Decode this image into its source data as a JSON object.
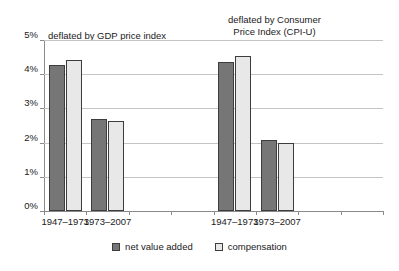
{
  "chart_data": {
    "type": "bar",
    "title": "",
    "xlabel": "",
    "ylabel": "",
    "ylim": [
      0,
      5
    ],
    "ytick_labels": [
      "5%",
      "4%",
      "3%",
      "2%",
      "1%",
      "0%"
    ],
    "ytick_values": [
      5,
      4,
      3,
      2,
      1,
      0
    ],
    "grid": true,
    "legend_position": "bottom",
    "categories": [
      "1947–1973",
      "1973–2007",
      "1947–1973",
      "1973–2007"
    ],
    "series": [
      {
        "name": "net value added",
        "color": "#767676",
        "values": [
          4.28,
          2.7,
          4.37,
          2.09
        ]
      },
      {
        "name": "compensation",
        "color": "#e8e8e8",
        "values": [
          4.42,
          2.62,
          4.52,
          2.0
        ]
      }
    ],
    "groups": [
      {
        "annotation": "deflated by GDP price index",
        "categories": [
          "1947–1973",
          "1973–2007"
        ]
      },
      {
        "annotation": "deflated by Consumer Price Index (CPI-U)",
        "categories": [
          "1947–1973",
          "1973–2007"
        ]
      }
    ],
    "annotations": [
      {
        "text": "deflated by GDP price index",
        "lines": [
          "deflated by GDP price index"
        ]
      },
      {
        "text": "deflated by Consumer Price Index (CPI-U)",
        "lines": [
          "deflated by Consumer",
          "Price Index (CPI-U)"
        ]
      }
    ]
  },
  "axis": {
    "y_labels": [
      "5%",
      "4%",
      "3%",
      "2%",
      "1%",
      "0%"
    ],
    "x_labels": [
      "1947–1973",
      "1973–2007",
      "1947–1973",
      "1973–2007"
    ]
  },
  "annotations": {
    "gdp_line1": "deflated by GDP price index",
    "cpi_line1": "deflated by Consumer",
    "cpi_line2": "Price Index (CPI-U)"
  },
  "legend": {
    "items": [
      {
        "label": "net value added",
        "color": "#767676"
      },
      {
        "label": "compensation",
        "color": "#e8e8e8"
      }
    ]
  },
  "colors": {
    "net_value_added": "#767676",
    "compensation": "#e8e8e8",
    "bar_border": "#3d3d3d",
    "gridline": "#c4c4c4",
    "axis": "#8a8a8a",
    "background": "#ffffff",
    "text": "#1a1a1a"
  }
}
